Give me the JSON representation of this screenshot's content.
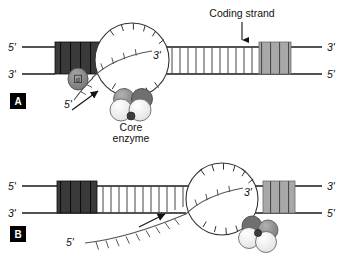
{
  "figure": {
    "background_color": "#ffffff",
    "width": 343,
    "height": 257
  },
  "colors": {
    "line": "#1a1a1a",
    "promoter_dark": "#3a3a3a",
    "promoter_stripe": "#111111",
    "terminator_gray": "#a8a8a8",
    "terminator_stripe": "#555555",
    "sigma_fill": "#8a8a8a",
    "core_dark": "#8c8c8c",
    "core_light": "#f2f2f2",
    "core_dot": "#3c3c3c",
    "panel_badge": "#000000",
    "text": "#111111"
  },
  "annotations": {
    "coding_strand": "Coding strand",
    "core_enzyme_line1": "Core",
    "core_enzyme_line2": "enzyme",
    "sigma_symbol": "σ"
  },
  "panels": [
    {
      "id": "A",
      "letter": "A",
      "stage": "initiation",
      "strand_labels": {
        "top_left": "5'",
        "bottom_left": "3'",
        "top_right": "3'",
        "bottom_right": "5'"
      },
      "rna_labels": {
        "three_prime": "3'",
        "five_prime": "5'"
      }
    },
    {
      "id": "B",
      "letter": "B",
      "stage": "elongation",
      "strand_labels": {
        "top_left": "5'",
        "bottom_left": "3'",
        "top_right": "3'",
        "bottom_right": "5'"
      },
      "rna_labels": {
        "three_prime": "3'",
        "five_prime": "5'"
      }
    }
  ]
}
